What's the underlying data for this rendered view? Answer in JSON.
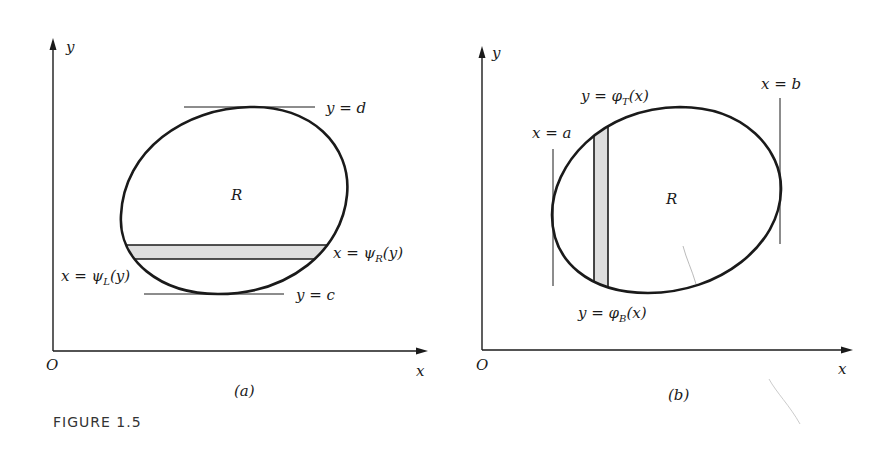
{
  "figure": {
    "caption": "FIGURE 1.5",
    "panels": [
      {
        "id": "a",
        "label": "(a)",
        "axis_x_label": "x",
        "axis_y_label": "y",
        "origin_label": "O",
        "region_label": "R",
        "top_bound_label": "y = d",
        "bottom_bound_label": "y = c",
        "left_curve_label": {
          "lhs": "x = ψ",
          "sub": "L",
          "rhs": "(y)"
        },
        "right_curve_label": {
          "lhs": "x = ψ",
          "sub": "R",
          "rhs": "(y)"
        },
        "strip_orientation": "horizontal"
      },
      {
        "id": "b",
        "label": "(b)",
        "axis_x_label": "x",
        "axis_y_label": "y",
        "origin_label": "O",
        "region_label": "R",
        "left_bound_label": "x = a",
        "right_bound_label": "x = b",
        "top_curve_label": {
          "lhs": "y = φ",
          "sub": "T",
          "rhs": "(x)"
        },
        "bottom_curve_label": {
          "lhs": "y = φ",
          "sub": "B",
          "rhs": "(x)"
        },
        "strip_orientation": "vertical"
      }
    ],
    "colors": {
      "ink": "#1a1a1a",
      "strip_fill": "#dedede",
      "background": "#ffffff"
    }
  }
}
